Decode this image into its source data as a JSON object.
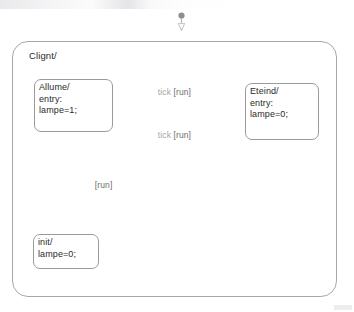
{
  "diagram": {
    "type": "statechart",
    "title_bar_artifact": "",
    "container": {
      "label": "Clignt/"
    },
    "states": [
      {
        "id": "allume",
        "name": "Allume/",
        "lines": "Allume/\nentry:\nlampe=1;",
        "entry_keyword": "entry:",
        "action": "lampe=1;"
      },
      {
        "id": "eteind",
        "name": "Eteind/",
        "lines": "Eteind/\nentry:\nlampe=0;",
        "entry_keyword": "entry:",
        "action": "lampe=0;"
      },
      {
        "id": "init",
        "name": "init/",
        "lines": "init/\nlampe=0;",
        "action": "lampe=0;"
      }
    ],
    "transitions": [
      {
        "id": "allume-to-eteind",
        "from": "allume",
        "to": "eteind",
        "event": "tick",
        "guard": "[run]"
      },
      {
        "id": "eteind-to-allume",
        "from": "eteind",
        "to": "allume",
        "event": "tick",
        "guard": "[run]"
      },
      {
        "id": "init-to-allume",
        "from": "init",
        "to": "allume",
        "event": "",
        "guard": "[run]"
      }
    ],
    "initial_markers": [
      {
        "id": "initial-marker-top",
        "target": "clignt-container"
      },
      {
        "id": "initial-marker-inner",
        "target": "init"
      }
    ],
    "colors": {
      "node_border": "#9a9a9a",
      "container_border": "#a8a8a8",
      "edge": "#b3b3b3",
      "text": "#2a2a2a",
      "event_text": "#a6a6a6",
      "guard_text": "#6d6d6d",
      "background": "#ffffff"
    }
  }
}
